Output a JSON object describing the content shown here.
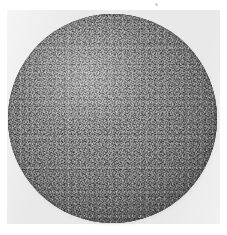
{
  "image": {
    "title": "Circular specimen plate",
    "subject": "textured dark disc",
    "caption": "",
    "label": ""
  },
  "canvas": {
    "width": 227,
    "height": 235,
    "page_background_color": "#ffffff"
  },
  "plate": {
    "background_color": "#e9e9e9",
    "left": 7,
    "top": 10,
    "width": 213,
    "height": 214
  },
  "disc": {
    "shape": "circle",
    "center_x": 112,
    "center_y": 118,
    "diameter": 209,
    "fill_color": "#9a9a9a",
    "rim_color": "#3b3b3b",
    "highlight_color": "#b2b2b2",
    "texture": "fine cross-hatch engraving with speckle grain"
  },
  "artifacts": {
    "speck_color": "#aaaaaa"
  }
}
